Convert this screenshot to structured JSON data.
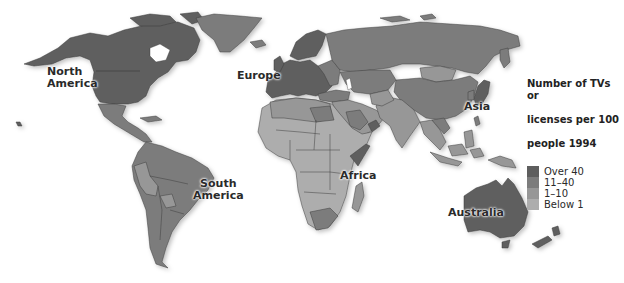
{
  "map": {
    "type": "choropleth",
    "subject": "Number of TVs or licenses per 100 people 1994",
    "region_labels": {
      "north_america": "North\nAmerica",
      "north_america_line1": "North",
      "north_america_line2": "America",
      "europe": "Europe",
      "asia": "Asia",
      "africa": "Africa",
      "south_america_line1": "South",
      "south_america_line2": "America",
      "australia": "Australia"
    }
  },
  "legend": {
    "title_line1": "Number of TVs or",
    "title_line2": "licenses per 100",
    "title_line3": "people 1994",
    "items": [
      {
        "label": "Over 40",
        "color": "#5e5e5e"
      },
      {
        "label": "11–40",
        "color": "#7c7c7c"
      },
      {
        "label": "1–10",
        "color": "#979797"
      },
      {
        "label": "Below 1",
        "color": "#adadad"
      }
    ]
  },
  "colors": {
    "over_40": "#5e5e5e",
    "c11_40": "#7c7c7c",
    "c1_10": "#979797",
    "below_1": "#adadad",
    "border": "#3f3f3f",
    "background": "#ffffff"
  }
}
